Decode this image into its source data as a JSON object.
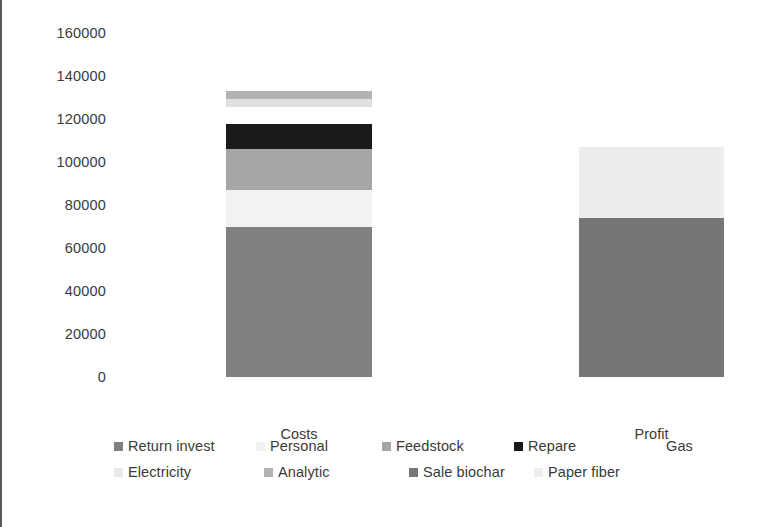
{
  "chart_data": {
    "type": "bar",
    "subtype": "stacked",
    "title": "",
    "xlabel": "",
    "ylabel": "",
    "categories": [
      "Costs",
      "Profit"
    ],
    "ylim": [
      0,
      160000
    ],
    "ytick_labels": [
      "160000",
      "140000",
      "120000",
      "100000",
      "80000",
      "60000",
      "40000",
      "20000",
      "0"
    ],
    "yticks": [
      160000,
      140000,
      120000,
      100000,
      80000,
      60000,
      40000,
      20000,
      0
    ],
    "grid": false,
    "legend_position": "bottom",
    "series": [
      {
        "name": "Return invest",
        "color": "#808080",
        "values": [
          69800,
          0
        ]
      },
      {
        "name": "Personal",
        "color": "#f2f2f2",
        "values": [
          17200,
          0
        ]
      },
      {
        "name": "Feedstock",
        "color": "#a6a6a6",
        "values": [
          19100,
          0
        ]
      },
      {
        "name": "Repare",
        "color": "#1a1a1a",
        "values": [
          11600,
          0
        ]
      },
      {
        "name": "Gas",
        "color": "#ffffff",
        "values": [
          7900,
          0
        ]
      },
      {
        "name": "Electricity",
        "color": "#e0e0e0",
        "values": [
          3700,
          0
        ]
      },
      {
        "name": "Analytic",
        "color": "#b3b3b3",
        "values": [
          3700,
          0
        ]
      },
      {
        "name": "Sale biochar",
        "color": "#767676",
        "values": [
          0,
          74000
        ]
      },
      {
        "name": "Paper fiber",
        "color": "#ededed",
        "values": [
          0,
          33000
        ]
      }
    ],
    "totals": [
      133100,
      107000
    ]
  },
  "legend": {
    "rows": [
      [
        {
          "label": "Return invest",
          "color": "#808080"
        },
        {
          "label": "Personal",
          "color": "#f2f2f2"
        },
        {
          "label": "Feedstock",
          "color": "#a6a6a6"
        },
        {
          "label": "Repare",
          "color": "#1a1a1a"
        },
        {
          "label": "Gas",
          "color": "#ffffff"
        }
      ],
      [
        {
          "label": "Electricity",
          "color": "#e8e8e8"
        },
        {
          "label": "Analytic",
          "color": "#b3b3b3"
        },
        {
          "label": "Sale biochar",
          "color": "#767676"
        },
        {
          "label": "Paper fiber",
          "color": "#ededed"
        }
      ]
    ]
  },
  "style": {
    "text_color": "#3a3a3a",
    "frame_color": "#5a5a5a",
    "background": "#ffffff"
  }
}
